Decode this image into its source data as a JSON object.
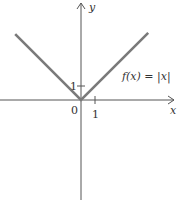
{
  "chart_data": {
    "type": "line",
    "title": "",
    "function_label": "f(x) = |x|",
    "xlabel": "x",
    "ylabel": "y",
    "origin_label": "0",
    "x_tick_labels": [
      "1"
    ],
    "y_tick_labels": [
      "1"
    ],
    "xlim": [
      -5.8,
      5.8
    ],
    "ylim": [
      -7.2,
      7.2
    ],
    "grid": false,
    "series": [
      {
        "name": "f(x) = |x|",
        "x": [
          -4.7,
          0,
          4.8
        ],
        "y": [
          4.7,
          0,
          4.8
        ]
      }
    ],
    "colors": {
      "graph": "#7a7a7a",
      "axes": "#555555"
    }
  }
}
